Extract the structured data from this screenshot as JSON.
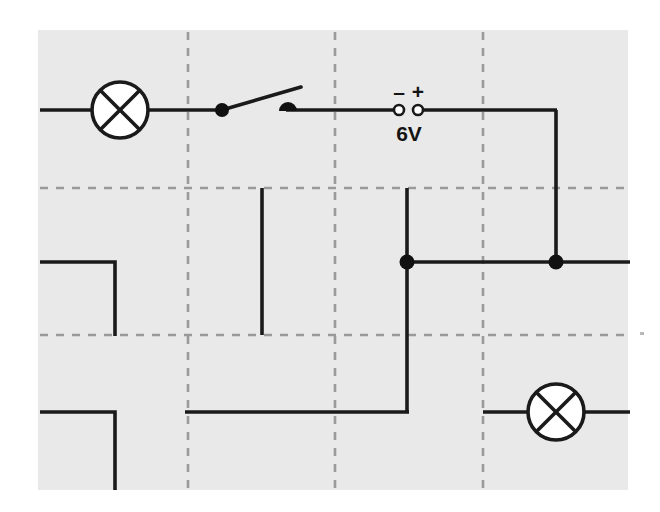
{
  "diagram": {
    "type": "electrical-circuit-schematic",
    "canvas": {
      "width": 660,
      "height": 512
    },
    "colors": {
      "page_background": "#ffffff",
      "panel_background": "#e9e9e9",
      "wire": "#1a1a1a",
      "grid_dash": "#9a9a9a",
      "component_fill": "#ffffff",
      "terminal_open_fill": "#ffffff",
      "node_fill": "#111111",
      "text": "#141414"
    },
    "panel": {
      "x": 38,
      "y": 30,
      "width": 590,
      "height": 460
    },
    "grid": {
      "style": "dashed",
      "vertical_lines_x": [
        188,
        335,
        483
      ],
      "horizontal_lines_y": [
        188,
        335
      ],
      "extent_x": [
        40,
        630
      ],
      "extent_y": [
        32,
        489
      ]
    },
    "components": [
      {
        "id": "lamp-top-left",
        "kind": "lamp",
        "symbol": "circle-with-cross",
        "cx": 120,
        "cy": 110,
        "r": 28
      },
      {
        "id": "switch-open",
        "kind": "switch",
        "state": "open",
        "pivot_x": 222,
        "pivot_y": 110,
        "contact_x": 288,
        "contact_y": 110,
        "lever_tip_x": 300,
        "lever_tip_y": 88
      },
      {
        "id": "power-supply",
        "kind": "power-supply",
        "minus_terminal_x": 399,
        "plus_terminal_x": 418,
        "terminal_y": 110,
        "terminal_r": 5
      },
      {
        "id": "lamp-bottom-right",
        "kind": "lamp",
        "symbol": "circle-with-cross",
        "cx": 556,
        "cy": 412,
        "r": 28
      }
    ],
    "junction_nodes": [
      {
        "id": "node-centre",
        "x": 407,
        "y": 262,
        "r": 7
      },
      {
        "id": "node-right",
        "x": 556,
        "y": 262,
        "r": 7
      }
    ],
    "labels": {
      "minus_sign": "–",
      "plus_sign": "+",
      "voltage": "6V"
    },
    "label_positions": {
      "minus": {
        "x": 399,
        "y": 95
      },
      "plus": {
        "x": 418,
        "y": 95
      },
      "voltage": {
        "x": 409,
        "y": 140
      }
    },
    "wires": [
      {
        "id": "wire-left-in-to-lamp",
        "points": "40,110 92,110"
      },
      {
        "id": "wire-lamp-to-switch",
        "points": "148,110 222,110"
      },
      {
        "id": "wire-switch-lever",
        "points": "222,110 300,88"
      },
      {
        "id": "wire-switch-to-supply",
        "points": "288,110 394,110"
      },
      {
        "id": "wire-supply-to-right-corner",
        "points": "423,110 556,110"
      },
      {
        "id": "wire-right-down-to-node",
        "points": "556,110 556,262"
      },
      {
        "id": "wire-node-right-to-edge",
        "points": "556,262 630,262"
      },
      {
        "id": "wire-node-centre-to-node-right",
        "points": "407,262 556,262"
      },
      {
        "id": "wire-centre-up-stub",
        "points": "407,188 407,262"
      },
      {
        "id": "wire-centre-down-to-bottom",
        "points": "407,262 407,412"
      },
      {
        "id": "wire-bottom-left-run",
        "points": "407,412 185,412"
      },
      {
        "id": "wire-mid-left-stub",
        "points": "262,188 262,335"
      },
      {
        "id": "wire-left-upper-corner",
        "points": "40,262 115,262 115,335"
      },
      {
        "id": "wire-left-lower-corner",
        "points": "40,412 115,412 115,490"
      },
      {
        "id": "wire-lamp2-left-lead",
        "points": "483,412 528,412"
      },
      {
        "id": "wire-lamp2-right-lead",
        "points": "584,412 630,412"
      }
    ],
    "speck": {
      "x": 640,
      "y": 333,
      "w": 4,
      "h": 3
    }
  }
}
